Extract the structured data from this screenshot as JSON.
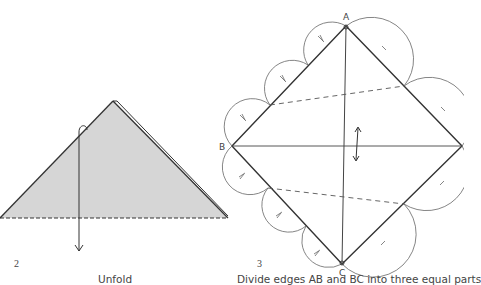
{
  "steps": [
    {
      "number": "2",
      "caption": "Unfold"
    },
    {
      "number": "3",
      "caption": "Divide edges AB and BC into three equal parts"
    }
  ],
  "points": {
    "a": "A",
    "b": "B",
    "c": "C"
  },
  "colors": {
    "fill": "#d6d6d6",
    "line": "#333333",
    "arc": "#555555"
  }
}
